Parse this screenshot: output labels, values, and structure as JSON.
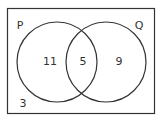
{
  "diagram": {
    "type": "venn",
    "sets": [
      {
        "name": "P",
        "label": "P"
      },
      {
        "name": "Q",
        "label": "Q"
      }
    ],
    "regions": {
      "p_only": "11",
      "p_and_q": "5",
      "q_only": "9",
      "neither": "3"
    },
    "colors": {
      "stroke": "#333333",
      "text": "#333333",
      "background": "#ffffff"
    }
  }
}
